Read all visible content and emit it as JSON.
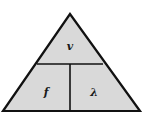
{
  "diagram": {
    "type": "formula-triangle",
    "top": {
      "label": "v"
    },
    "bottom_left": {
      "label": "f"
    },
    "bottom_right": {
      "label": "λ"
    },
    "colors": {
      "fill": "#d9d9d9",
      "stroke": "#111111"
    }
  }
}
